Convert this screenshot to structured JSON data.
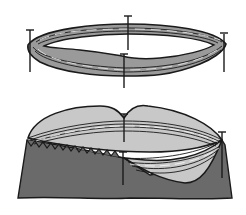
{
  "figure": {
    "title": "",
    "panels": [
      {
        "id": "top",
        "description": "Coiled ring of strands secured by pins"
      },
      {
        "id": "bottom",
        "description": "Coiled ring pinned onto fabric cup with pinked edge"
      }
    ]
  },
  "colors": {
    "background": "#ffffff",
    "outline": "#1a1a1a",
    "coil_fill": "#9a9a9a",
    "light_fill": "#c8c8c8",
    "fabric_fill": "#6a6a6a",
    "strand_highlight": "#d8d8d8"
  }
}
